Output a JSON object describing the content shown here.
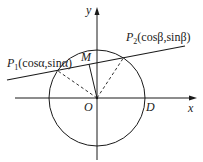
{
  "diagram": {
    "type": "unit-circle-chord",
    "labels": {
      "y_axis": "y",
      "x_axis": "x",
      "origin": "O",
      "point_d": "D",
      "point_m": "M",
      "p1_name": "P",
      "p1_sub": "1",
      "p1_coords": "(cosα,sinα)",
      "p2_name": "P",
      "p2_sub": "2",
      "p2_coords": "(cosβ,sinβ)"
    },
    "geometry": {
      "origin": [
        97,
        98
      ],
      "radius": 48,
      "line": [
        [
          7,
          80
        ],
        [
          185,
          46
        ]
      ],
      "p1": [
        58,
        71
      ],
      "p2": [
        124,
        57
      ],
      "m": [
        89,
        64
      ]
    },
    "colors": {
      "stroke": "#1a1a1a",
      "background": "#ffffff"
    }
  }
}
